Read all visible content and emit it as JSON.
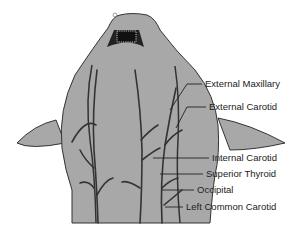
{
  "diagram": {
    "fill_color": "#a8a8a8",
    "line_color": "#333333",
    "labels": [
      {
        "id": "external-maxillary",
        "text": "External Maxillary",
        "x": 205,
        "y": 79
      },
      {
        "id": "external-carotid",
        "text": "External Carotid",
        "x": 209,
        "y": 104
      },
      {
        "id": "internal-carotid",
        "text": "Internal Carotid",
        "x": 212,
        "y": 155
      },
      {
        "id": "superior-thyroid",
        "text": "Superior Thyroid",
        "x": 206,
        "y": 170
      },
      {
        "id": "occipital",
        "text": "Occipital",
        "x": 197,
        "y": 186
      },
      {
        "id": "left-common-carotid",
        "text": "Left Common Carotid",
        "x": 186,
        "y": 203
      }
    ]
  }
}
